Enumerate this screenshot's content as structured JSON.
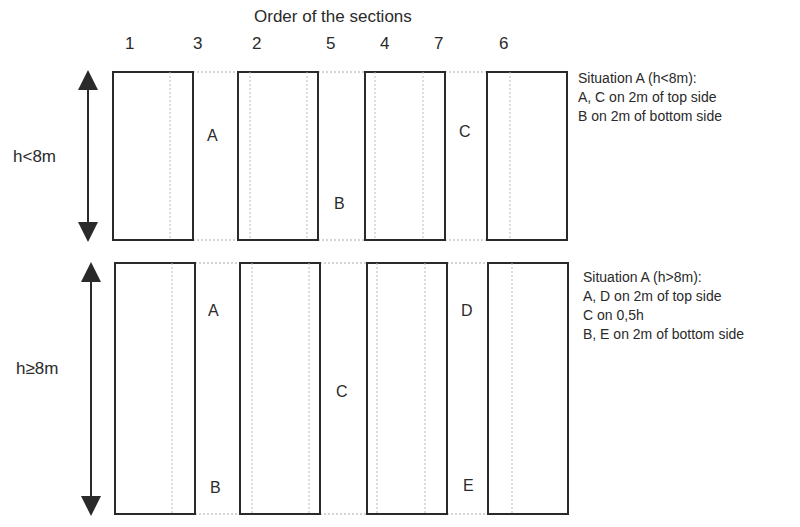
{
  "title": "Order of the sections",
  "section_order": [
    {
      "label": "1",
      "x": 129
    },
    {
      "label": "3",
      "x": 197
    },
    {
      "label": "2",
      "x": 256
    },
    {
      "label": "5",
      "x": 330
    },
    {
      "label": "4",
      "x": 384
    },
    {
      "label": "7",
      "x": 438
    },
    {
      "label": "6",
      "x": 503
    }
  ],
  "top_case": {
    "height_label": "h<8m",
    "points": {
      "A": "A",
      "B": "B",
      "C": "C"
    },
    "legend": {
      "heading": "Situation A (h<8m):",
      "line1": "A, C on 2m of top side",
      "line2": "B on 2m of bottom side"
    }
  },
  "bottom_case": {
    "height_label": "h≥8m",
    "points": {
      "A": "A",
      "B": "B",
      "C": "C",
      "D": "D",
      "E": "E"
    },
    "legend": {
      "heading": "Situation A (h>8m):",
      "line1": "A, D on 2m of top side",
      "line2": "C on 0,5h",
      "line3": "B, E on 2m of bottom side"
    }
  },
  "colors": {
    "stroke": "#2a2a2a",
    "dotted": "#aaaaaa"
  }
}
